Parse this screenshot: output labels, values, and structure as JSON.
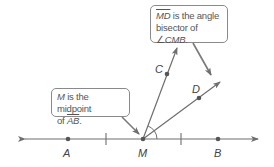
{
  "diagram": {
    "type": "geometry",
    "colors": {
      "line": "#6e6e6e",
      "point": "#555555",
      "callout_border": "#8a8a8a",
      "text": "#555555"
    },
    "points": {
      "A": {
        "label": "A",
        "x": 68,
        "y": 139
      },
      "M": {
        "label": "M",
        "x": 143,
        "y": 139
      },
      "B": {
        "label": "B",
        "x": 218,
        "y": 139
      },
      "C": {
        "label": "C",
        "x": 167,
        "y": 74
      },
      "D": {
        "label": "D",
        "x": 199,
        "y": 98
      }
    },
    "line_AB": {
      "description": "line through A, M, B with arrows at both ends"
    },
    "ray_MC": {
      "description": "ray from M through C"
    },
    "ray_MD": {
      "description": "ray from M through D"
    },
    "tick_marks": {
      "description": "congruence ticks on AM and MB"
    },
    "angle_arc": {
      "description": "angle mark at M between MC and MB"
    }
  },
  "callouts": {
    "top": {
      "segment": "MD",
      "text_after_segment": " is the angle",
      "line2_prefix": "bisector of ",
      "angle_symbol": "∠",
      "angle_name": "CMB",
      "line2_suffix": "."
    },
    "left": {
      "point": "M",
      "line1_rest": " is the midpoint",
      "line2_prefix": "of ",
      "segment": "AB",
      "line2_suffix": "."
    }
  }
}
